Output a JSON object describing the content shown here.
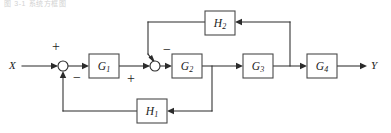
{
  "figure": {
    "kind": "control-system-block-diagram",
    "caption_faint": "图 3-1 系统方框图",
    "width": 391,
    "height": 133,
    "background_color": "#ffffff",
    "line_color": "#2b2b2b",
    "block_border_color": "#4a4a4a",
    "block_fill_color": "#ffffff"
  },
  "signals": {
    "input": {
      "label": "X",
      "x": 12,
      "y": 66
    },
    "output": {
      "label": "Y",
      "x": 372,
      "y": 66
    }
  },
  "blocks": [
    {
      "id": "G1",
      "base": "G",
      "sub": "1",
      "x": 89,
      "y": 54,
      "w": 30,
      "h": 24
    },
    {
      "id": "G2",
      "base": "G",
      "sub": "2",
      "x": 172,
      "y": 54,
      "w": 30,
      "h": 24
    },
    {
      "id": "G3",
      "base": "G",
      "sub": "3",
      "x": 243,
      "y": 54,
      "w": 30,
      "h": 24
    },
    {
      "id": "G4",
      "base": "G",
      "sub": "4",
      "x": 307,
      "y": 54,
      "w": 30,
      "h": 24
    },
    {
      "id": "H1",
      "base": "H",
      "sub": "1",
      "x": 137,
      "y": 99,
      "w": 30,
      "h": 24
    },
    {
      "id": "H2",
      "base": "H",
      "sub": "2",
      "x": 205,
      "y": 11,
      "w": 30,
      "h": 24
    }
  ],
  "summing_junctions": [
    {
      "id": "sum1",
      "cx": 63,
      "cy": 66,
      "r": 5,
      "signs": [
        {
          "symbol": "+",
          "position": "top",
          "x": 56,
          "y": 48
        },
        {
          "symbol": "−",
          "position": "bottom-right",
          "x": 77,
          "y": 79
        }
      ]
    },
    {
      "id": "sum2",
      "cx": 155,
      "cy": 66,
      "r": 5,
      "signs": [
        {
          "symbol": "−",
          "position": "top-right",
          "x": 167,
          "y": 51
        },
        {
          "symbol": "+",
          "position": "bottom-left",
          "x": 131,
          "y": 80
        }
      ]
    }
  ],
  "connections": [
    {
      "id": "x-to-sum1",
      "from": "X",
      "to": "sum1",
      "type": "forward"
    },
    {
      "id": "sum1-to-g1",
      "from": "sum1",
      "to": "G1",
      "type": "forward"
    },
    {
      "id": "g1-to-sum2",
      "from": "G1",
      "to": "sum2",
      "type": "forward"
    },
    {
      "id": "sum2-to-g2",
      "from": "sum2",
      "to": "G2",
      "type": "forward"
    },
    {
      "id": "g2-to-g3",
      "from": "G2",
      "to": "G3",
      "type": "forward"
    },
    {
      "id": "g3-to-g4",
      "from": "G3",
      "to": "G4",
      "type": "forward"
    },
    {
      "id": "g4-to-y",
      "from": "G4",
      "to": "Y",
      "type": "forward"
    },
    {
      "id": "g2out-to-h1",
      "from": "G2-output-branch",
      "to": "H1",
      "type": "feedback-inner"
    },
    {
      "id": "h1-to-sum1",
      "from": "H1",
      "to": "sum1",
      "type": "feedback-inner"
    },
    {
      "id": "g3out-to-h2",
      "from": "G3-output-branch",
      "to": "H2",
      "type": "feedback-inner"
    },
    {
      "id": "h2-to-sum2",
      "from": "H2",
      "to": "sum2",
      "type": "feedback-inner"
    }
  ]
}
